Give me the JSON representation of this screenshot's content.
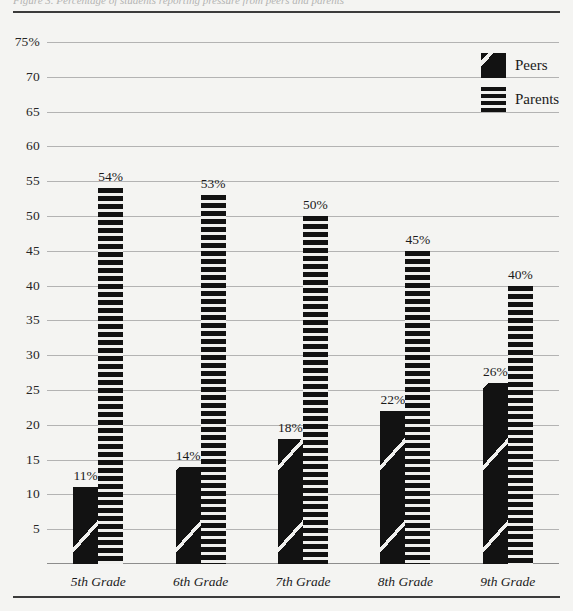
{
  "figure": {
    "cut_caption": "Figure 3.  Percentage of students reporting pressure from peers and parents",
    "background_color": "#f4f4f2",
    "rule_color": "#3b3b3b",
    "gridline_color": "#b3b3b3"
  },
  "legend": {
    "position": "top-right",
    "items": [
      {
        "label": "Peers",
        "pattern": "diagonal-stripe",
        "color": "#121212"
      },
      {
        "label": "Parents",
        "pattern": "horizontal-stripe",
        "color": "#121212"
      }
    ]
  },
  "chart_data": {
    "type": "bar",
    "title": "",
    "xlabel": "",
    "ylabel": "",
    "ylim": [
      0,
      75
    ],
    "ytick_labels": [
      "75%",
      "70",
      "65",
      "60",
      "55",
      "50",
      "45",
      "40",
      "35",
      "30",
      "25",
      "20",
      "15",
      "10",
      "5"
    ],
    "ytick_values": [
      75,
      70,
      65,
      60,
      55,
      50,
      45,
      40,
      35,
      30,
      25,
      20,
      15,
      10,
      5
    ],
    "grid": true,
    "legend_position": "top-right",
    "categories": [
      "5th Grade",
      "6th Grade",
      "7th Grade",
      "8th Grade",
      "9th Grade"
    ],
    "series": [
      {
        "name": "Peers",
        "values": [
          11,
          14,
          18,
          22,
          26
        ],
        "data_labels": [
          "11%",
          "14%",
          "18%",
          "22%",
          "26%"
        ]
      },
      {
        "name": "Parents",
        "values": [
          54,
          53,
          50,
          45,
          40
        ],
        "data_labels": [
          "54%",
          "53%",
          "50%",
          "45%",
          "40%"
        ]
      }
    ]
  }
}
